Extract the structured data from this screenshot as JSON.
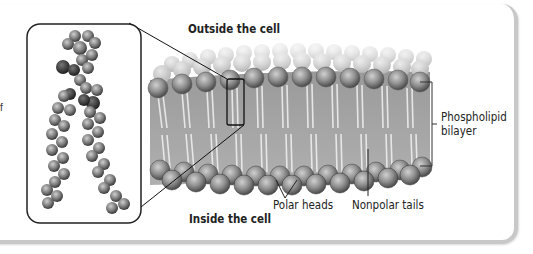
{
  "figure": {
    "top_label": "Outside the cell",
    "bottom_label": "Inside the cell",
    "side_label_line1": "Phospholipid",
    "side_label_line2": "bilayer",
    "callout_polar": "Polar heads",
    "callout_nonpolar": "Nonpolar tails",
    "cutoff_text": "f"
  },
  "colors": {
    "head_fill": "#8a8a8a",
    "tail_fill": "#d8d8d8",
    "outline": "#222222",
    "card_edge": "#c8c8c8"
  }
}
